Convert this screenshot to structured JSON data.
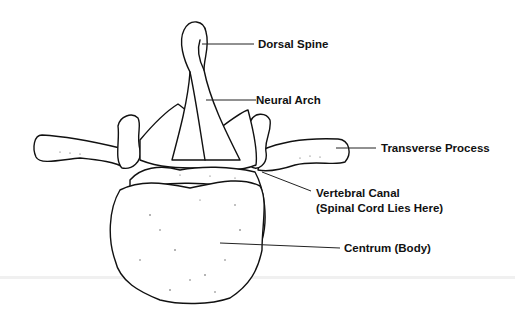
{
  "figure": {
    "subject": "vertebra",
    "labels": [
      {
        "id": "dorsal-spine",
        "text": "Dorsal Spine"
      },
      {
        "id": "neural-arch",
        "text": "Neural Arch"
      },
      {
        "id": "transverse-process",
        "text": "Transverse Process"
      },
      {
        "id": "vertebral-canal",
        "text": "Vertebral Canal"
      },
      {
        "id": "vertebral-canal-note",
        "text": "(Spinal Cord Lies Here)"
      },
      {
        "id": "centrum",
        "text": "Centrum (Body)"
      }
    ]
  }
}
